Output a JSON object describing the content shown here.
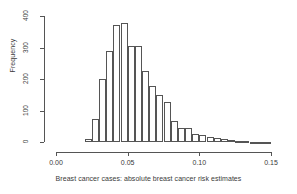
{
  "chart_data": {
    "type": "bar",
    "subtype": "histogram",
    "title": "",
    "xlabel": "Breast cancer cases: absolute breast cancer risk estimates",
    "ylabel": "Frequency",
    "xlim": [
      0.0,
      0.15
    ],
    "ylim": [
      0,
      400
    ],
    "xticks": [
      0.0,
      0.05,
      0.1,
      0.15
    ],
    "xtick_labels": [
      "0.00",
      "0.05",
      "0.10",
      "0.15"
    ],
    "yticks": [
      0,
      100,
      200,
      300,
      400
    ],
    "ytick_labels": [
      "0",
      "100",
      "200",
      "300",
      "400"
    ],
    "grid": false,
    "legend": false,
    "bin_width": 0.005,
    "bin_starts": [
      0.02,
      0.025,
      0.03,
      0.035,
      0.04,
      0.045,
      0.05,
      0.055,
      0.06,
      0.065,
      0.07,
      0.075,
      0.08,
      0.085,
      0.09,
      0.095,
      0.1,
      0.105,
      0.11,
      0.115,
      0.12,
      0.125,
      0.13,
      0.135,
      0.14,
      0.145
    ],
    "categories": [
      "0.020",
      "0.025",
      "0.030",
      "0.035",
      "0.040",
      "0.045",
      "0.050",
      "0.055",
      "0.060",
      "0.065",
      "0.070",
      "0.075",
      "0.080",
      "0.085",
      "0.090",
      "0.095",
      "0.100",
      "0.105",
      "0.110",
      "0.115",
      "0.120",
      "0.125",
      "0.130",
      "0.135",
      "0.140",
      "0.145"
    ],
    "values": [
      10,
      72,
      200,
      290,
      373,
      378,
      305,
      304,
      226,
      178,
      148,
      127,
      68,
      44,
      46,
      26,
      21,
      17,
      12,
      9,
      6,
      3,
      2,
      1,
      1,
      1
    ]
  },
  "axes": {
    "y_title": "Frequency",
    "x_title": "Breast cancer cases: absolute breast cancer risk estimates"
  },
  "style": {
    "line_color": "#555555",
    "text_color": "#3a3a3a",
    "background": "#ffffff"
  }
}
